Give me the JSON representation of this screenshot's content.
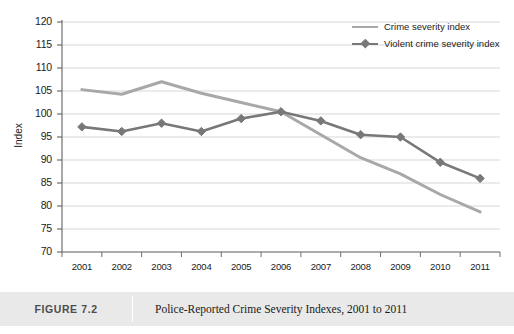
{
  "chart_data": {
    "type": "line",
    "title": "Police-Reported Crime Severity Indexes, 2001 to 2011",
    "xlabel": "",
    "ylabel": "Index",
    "categories": [
      "2001",
      "2002",
      "2003",
      "2004",
      "2005",
      "2006",
      "2007",
      "2008",
      "2009",
      "2010",
      "2011"
    ],
    "ylim": [
      70,
      120
    ],
    "yticks": [
      70,
      75,
      80,
      85,
      90,
      95,
      100,
      105,
      110,
      115,
      120
    ],
    "grid": true,
    "legend_position": "top-right",
    "series": [
      {
        "name": "Crime severity index",
        "color": "#a8a8a8",
        "marker": "none",
        "values": [
          105.3,
          104.3,
          107.0,
          104.5,
          102.5,
          100.5,
          95.5,
          90.5,
          87.0,
          82.5,
          78.7
        ]
      },
      {
        "name": "Violent crime severity index",
        "color": "#787878",
        "marker": "diamond",
        "values": [
          97.2,
          96.2,
          98.0,
          96.2,
          99.0,
          100.5,
          98.5,
          95.5,
          95.0,
          89.5,
          86.0
        ]
      }
    ]
  },
  "caption": {
    "number": "FIGURE 7.2",
    "title": "Police-Reported Crime Severity Indexes, 2001 to 2011"
  },
  "colors": {
    "gridline": "#d7d7d7",
    "axis": "#6e6e6e",
    "caption_band": "#e9e9e9",
    "series_light": "#a8a8a8",
    "series_dark": "#787878"
  }
}
